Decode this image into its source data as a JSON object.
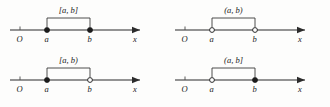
{
  "figure": {
    "background_color": "#fdfdfc",
    "line_color": "#2b2b2b",
    "axis_label": "x",
    "origin_label": "O",
    "point_a_label": "a",
    "point_b_label": "b"
  },
  "panels": [
    {
      "id": "closed-interval",
      "position": "top-left",
      "interval_label": "[a, b]",
      "left_endpoint": "closed",
      "right_endpoint": "closed",
      "origin_label": "O",
      "point_a_label": "a",
      "point_b_label": "b",
      "axis_label": "x"
    },
    {
      "id": "open-interval",
      "position": "top-right",
      "interval_label": "(a, b)",
      "left_endpoint": "open",
      "right_endpoint": "open",
      "origin_label": "O",
      "point_a_label": "a",
      "point_b_label": "b",
      "axis_label": "x"
    },
    {
      "id": "half-open-right",
      "position": "bottom-left",
      "interval_label": "[a, b)",
      "left_endpoint": "closed",
      "right_endpoint": "open",
      "origin_label": "O",
      "point_a_label": "a",
      "point_b_label": "b",
      "axis_label": "x"
    },
    {
      "id": "half-open-left",
      "position": "bottom-right",
      "interval_label": "(a, b]",
      "left_endpoint": "open",
      "right_endpoint": "closed",
      "origin_label": "O",
      "point_a_label": "a",
      "point_b_label": "b",
      "axis_label": "x"
    }
  ],
  "diagram_data": {
    "type": "number-line",
    "variable": "x",
    "origin": "O",
    "marked_points": [
      "a",
      "b"
    ],
    "intervals": [
      "[a, b]",
      "(a, b)",
      "[a, b)",
      "(a, b]"
    ],
    "endpoint_styles": [
      [
        "closed",
        "closed"
      ],
      [
        "open",
        "open"
      ],
      [
        "closed",
        "open"
      ],
      [
        "open",
        "closed"
      ]
    ]
  }
}
